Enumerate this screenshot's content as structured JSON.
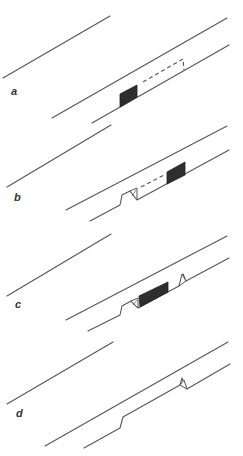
{
  "figure": {
    "panels": [
      {
        "id": "a",
        "label": "a"
      },
      {
        "id": "b",
        "label": "b"
      },
      {
        "id": "c",
        "label": "c"
      },
      {
        "id": "d",
        "label": "d"
      }
    ]
  },
  "colors": {
    "line": "#555555",
    "block": "#2e2e2e",
    "background": "#ffffff"
  }
}
